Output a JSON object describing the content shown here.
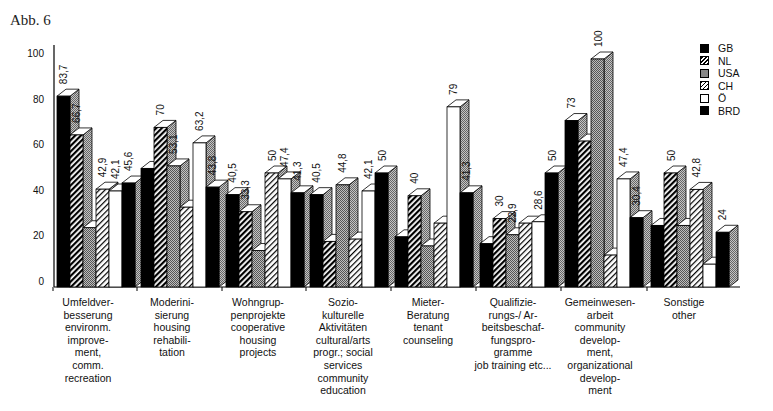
{
  "figure_label": "Abb. 6",
  "chart_data": {
    "type": "bar",
    "title": "",
    "xlabel": "",
    "ylabel": "",
    "ylim": [
      0,
      100
    ],
    "yticks": [
      0,
      20,
      40,
      60,
      80,
      100
    ],
    "grid": false,
    "legend_position": "top-right",
    "categories": [
      "Umfeldver-\nbesserung\nenvironm.\nimprove-\nment,\ncomm.\nrecreation",
      "Moderini-\nsierung\nhousing\nrehabili-\ntation",
      "Wohngrup-\npenprojekte\ncooperative\nhousing\nprojects",
      "Sozio-\nkulturelle\nAktivitäten\ncultural/arts\nprogr.; social\nservices\ncommunity\neducation",
      "Mieter-\nBeratung\ntenant\ncounseling",
      "Qualifizie-\nrungs-/ Ar-\nbeitsbeschaf-\nfungspro-\ngramme\njob training etc...",
      "Gemeinwesen-\narbeit\ncommunity\ndevelop-\nment,\norganizational\ndevelop-\nment",
      "Sonstige\nother"
    ],
    "series": [
      {
        "name": "GB",
        "pattern": "solid-black",
        "values": [
          83.7,
          52,
          40.5,
          40.5,
          22,
          19,
          73,
          27
        ]
      },
      {
        "name": "NL",
        "pattern": "dark-hatch",
        "values": [
          66.7,
          70,
          33,
          20,
          40,
          30,
          64,
          50
        ]
      },
      {
        "name": "USA",
        "pattern": "gray-dots",
        "values": [
          26,
          53.1,
          16,
          44.8,
          18,
          22.9,
          100,
          27
        ]
      },
      {
        "name": "CH",
        "pattern": "light-hatch",
        "values": [
          42.9,
          35,
          50,
          21,
          28,
          28,
          14,
          42.8
        ]
      },
      {
        "name": "Ö",
        "pattern": "white",
        "values": [
          42.1,
          63.2,
          47.4,
          42.1,
          79,
          28.6,
          47.4,
          10
        ]
      },
      {
        "name": "BRD",
        "pattern": "solid-black",
        "values": [
          45.6,
          43.8,
          41.3,
          50,
          41.3,
          50,
          30.4,
          24
        ]
      }
    ],
    "data_labels": [
      [
        "83,7",
        "66,7",
        "",
        "42,9",
        "42,1",
        "45,6"
      ],
      [
        "",
        "70",
        "53,1",
        "",
        "63,2",
        "43,8"
      ],
      [
        "40,5",
        "33,3",
        "",
        "50",
        "47,4",
        "41,3"
      ],
      [
        "40,5",
        "",
        "44,8",
        "",
        "42,1",
        "50"
      ],
      [
        "",
        "40",
        "",
        "",
        "79",
        "41,3"
      ],
      [
        "",
        "30",
        "22,9",
        "",
        "28,6",
        "50"
      ],
      [
        "73",
        "",
        "100",
        "",
        "47,4",
        "30,4"
      ],
      [
        "",
        "50",
        "",
        "42,8",
        "",
        "24"
      ]
    ]
  },
  "legend": {
    "items": [
      {
        "label": "GB"
      },
      {
        "label": "NL"
      },
      {
        "label": "USA"
      },
      {
        "label": "CH"
      },
      {
        "label": "Ö"
      },
      {
        "label": "BRD"
      }
    ]
  }
}
